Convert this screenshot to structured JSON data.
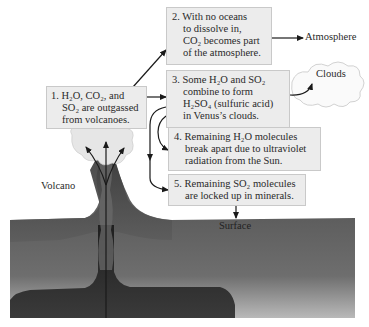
{
  "diagram": {
    "labels": {
      "atmosphere": "Atmosphere",
      "clouds": "Clouds",
      "volcano": "Volcano",
      "surface": "Surface"
    },
    "steps": [
      {
        "number": "1.",
        "lines": [
          "H₂O, CO₂, and",
          "SO₂ are outgassed",
          "from volcanoes."
        ]
      },
      {
        "number": "2.",
        "lines": [
          "With no oceans",
          "to dissolve in,",
          "CO₂ becomes part",
          "of the atmosphere."
        ]
      },
      {
        "number": "3.",
        "lines": [
          "Some H₂O and SO₂",
          "combine to form",
          "H₂SO₄ (sulfuric acid)",
          "in Venus’s clouds."
        ]
      },
      {
        "number": "4.",
        "lines": [
          "Remaining H₂O molecules",
          "break apart due to ultraviolet",
          "radiation from the Sun."
        ]
      },
      {
        "number": "5.",
        "lines": [
          "Remaining SO₂ molecules",
          "are locked up in minerals."
        ]
      }
    ],
    "colors": {
      "box_fill": "#ececec",
      "box_border": "#c9c9c9",
      "ground_dark": "#3a3a3a",
      "ground_light": "#8a8a8a",
      "arrow": "#1a1a1a"
    }
  }
}
